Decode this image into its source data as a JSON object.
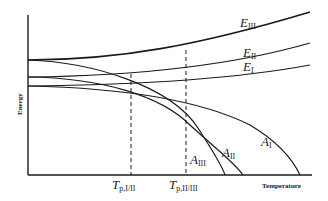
{
  "diagram": {
    "type": "energy-temperature phase diagram",
    "axes": {
      "y_label": "Energy",
      "x_label": "Temperature"
    },
    "curves": [
      {
        "id": "E_III",
        "symbol": "E",
        "subscript": "III",
        "kind": "energy"
      },
      {
        "id": "E_II",
        "symbol": "E",
        "subscript": "II",
        "kind": "energy"
      },
      {
        "id": "E_I",
        "symbol": "E",
        "subscript": "I",
        "kind": "energy"
      },
      {
        "id": "A_I",
        "symbol": "A",
        "subscript": "I",
        "kind": "free-energy"
      },
      {
        "id": "A_II",
        "symbol": "A",
        "subscript": "II",
        "kind": "free-energy"
      },
      {
        "id": "A_III",
        "symbol": "A",
        "subscript": "III",
        "kind": "free-energy"
      }
    ],
    "transitions": [
      {
        "id": "Tp_I_II",
        "symbol": "T",
        "subscript": "p,I/II",
        "style": "dashed"
      },
      {
        "id": "Tp_II_III",
        "symbol": "T",
        "subscript": "p,II/III",
        "style": "dashed"
      }
    ],
    "colors": {
      "line": "#1a1a1a",
      "background": "#ffffff"
    }
  }
}
